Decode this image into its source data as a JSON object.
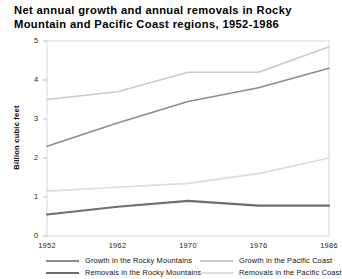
{
  "chart_data": {
    "type": "line",
    "title": "Net annual growth and annual removals in Rocky Mountain and Pacific Coast regions, 1952-1986",
    "xlabel": "",
    "ylabel": "Billion cubic feet",
    "categories": [
      "1952",
      "1962",
      "1970",
      "1976",
      "1986"
    ],
    "ylim": [
      0,
      5
    ],
    "yticks": [
      "0",
      "1",
      "2",
      "3",
      "4",
      "5"
    ],
    "grid": false,
    "legend_position": "bottom",
    "series": [
      {
        "name": "Growth in the Rocky Mountains",
        "values": [
          2.3,
          2.9,
          3.45,
          3.8,
          4.3
        ],
        "color": "#8c8c8c",
        "width": 1.6
      },
      {
        "name": "Growth in the Pacific Coast",
        "values": [
          3.5,
          3.7,
          4.2,
          4.2,
          4.85
        ],
        "color": "#c9c9c9",
        "width": 1.6
      },
      {
        "name": "Removals in the Rocky Mountains",
        "values": [
          0.55,
          0.75,
          0.9,
          0.78,
          0.78
        ],
        "color": "#6e6e6e",
        "width": 2.1
      },
      {
        "name": "Removals in the Pacific Coast",
        "values": [
          1.15,
          1.25,
          1.35,
          1.6,
          2.0
        ],
        "color": "#dcdcdc",
        "width": 1.6
      }
    ]
  },
  "axis": {
    "frame_color": "#d8d8d8",
    "tick_color": "#bdbdbd"
  }
}
